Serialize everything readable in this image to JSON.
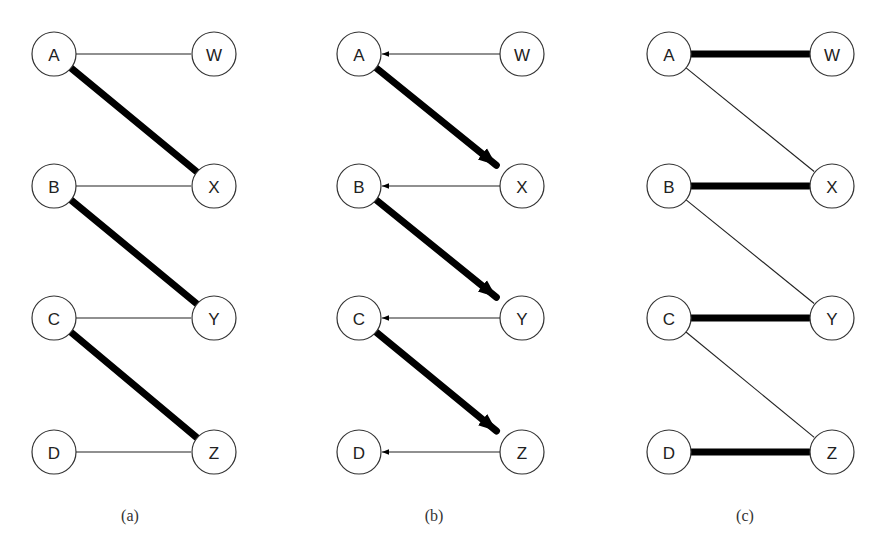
{
  "figure": {
    "node_radius": 22,
    "rows_y": [
      54,
      186,
      318,
      452
    ],
    "panels": [
      {
        "id": "a",
        "caption": "(a)",
        "caption_pos": [
          130,
          521
        ],
        "left_x": 54,
        "right_x": 214,
        "left_nodes": [
          "A",
          "B",
          "C",
          "D"
        ],
        "right_nodes": [
          "W",
          "X",
          "Y",
          "Z"
        ],
        "edges": [
          {
            "from": "A",
            "to": "W",
            "style": "thin",
            "directed": false
          },
          {
            "from": "A",
            "to": "X",
            "style": "thick",
            "directed": false
          },
          {
            "from": "B",
            "to": "X",
            "style": "thin",
            "directed": false
          },
          {
            "from": "B",
            "to": "Y",
            "style": "thick",
            "directed": false
          },
          {
            "from": "C",
            "to": "Y",
            "style": "thin",
            "directed": false
          },
          {
            "from": "C",
            "to": "Z",
            "style": "thick",
            "directed": false
          },
          {
            "from": "D",
            "to": "Z",
            "style": "thin",
            "directed": false
          }
        ]
      },
      {
        "id": "b",
        "caption": "(b)",
        "caption_pos": [
          434,
          521
        ],
        "left_x": 359,
        "right_x": 522,
        "left_nodes": [
          "A",
          "B",
          "C",
          "D"
        ],
        "right_nodes": [
          "W",
          "X",
          "Y",
          "Z"
        ],
        "edges": [
          {
            "from": "W",
            "to": "A",
            "style": "thin",
            "directed": true
          },
          {
            "from": "A",
            "to": "X",
            "style": "thick",
            "directed": true
          },
          {
            "from": "X",
            "to": "B",
            "style": "thin",
            "directed": true
          },
          {
            "from": "B",
            "to": "Y",
            "style": "thick",
            "directed": true
          },
          {
            "from": "Y",
            "to": "C",
            "style": "thin",
            "directed": true
          },
          {
            "from": "C",
            "to": "Z",
            "style": "thick",
            "directed": true
          },
          {
            "from": "Z",
            "to": "D",
            "style": "thin",
            "directed": true
          }
        ]
      },
      {
        "id": "c",
        "caption": "(c)",
        "caption_pos": [
          745,
          521
        ],
        "left_x": 669,
        "right_x": 832,
        "left_nodes": [
          "A",
          "B",
          "C",
          "D"
        ],
        "right_nodes": [
          "W",
          "X",
          "Y",
          "Z"
        ],
        "edges": [
          {
            "from": "A",
            "to": "W",
            "style": "thick",
            "directed": false
          },
          {
            "from": "A",
            "to": "X",
            "style": "thin",
            "directed": false
          },
          {
            "from": "B",
            "to": "X",
            "style": "thick",
            "directed": false
          },
          {
            "from": "B",
            "to": "Y",
            "style": "thin",
            "directed": false
          },
          {
            "from": "C",
            "to": "Y",
            "style": "thick",
            "directed": false
          },
          {
            "from": "C",
            "to": "Z",
            "style": "thin",
            "directed": false
          },
          {
            "from": "D",
            "to": "Z",
            "style": "thick",
            "directed": false
          }
        ]
      }
    ]
  }
}
